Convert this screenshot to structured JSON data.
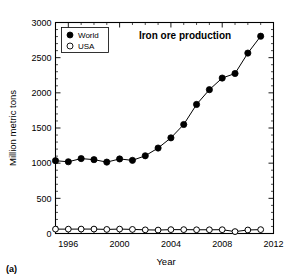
{
  "figure": {
    "panel_label": "(a)"
  },
  "chart_data": {
    "type": "line",
    "title": "Iron ore production",
    "xlabel": "Year",
    "ylabel": "Million metric tons",
    "xlim": [
      1995,
      2012
    ],
    "ylim": [
      0,
      3000
    ],
    "xticks": [
      1996,
      2000,
      2004,
      2008,
      2012
    ],
    "xticklabels": [
      "1996",
      "2000",
      "2004",
      "2008",
      "2012"
    ],
    "xtick_minor_step": 1,
    "yticks": [
      0,
      500,
      1000,
      1500,
      2000,
      2500,
      3000
    ],
    "yticklabels": [
      "0",
      "500",
      "1000",
      "1500",
      "2000",
      "2500",
      "3000"
    ],
    "ytick_minor_step": 100,
    "grid": false,
    "legend_position": "upper-left",
    "x": [
      1995,
      1996,
      1997,
      1998,
      1999,
      2000,
      2001,
      2002,
      2003,
      2004,
      2005,
      2006,
      2007,
      2008,
      2009,
      2010,
      2011
    ],
    "series": [
      {
        "name": "World",
        "marker": "filled-circle",
        "color": "#000000",
        "values": [
          1035,
          1020,
          1065,
          1050,
          1015,
          1060,
          1040,
          1105,
          1215,
          1360,
          1550,
          1835,
          2045,
          2210,
          2275,
          2565,
          2805
        ]
      },
      {
        "name": "USA",
        "marker": "open-circle",
        "color": "#000000",
        "values": [
          62,
          62,
          63,
          63,
          58,
          63,
          58,
          52,
          49,
          55,
          55,
          53,
          53,
          54,
          27,
          50,
          55
        ]
      }
    ]
  }
}
